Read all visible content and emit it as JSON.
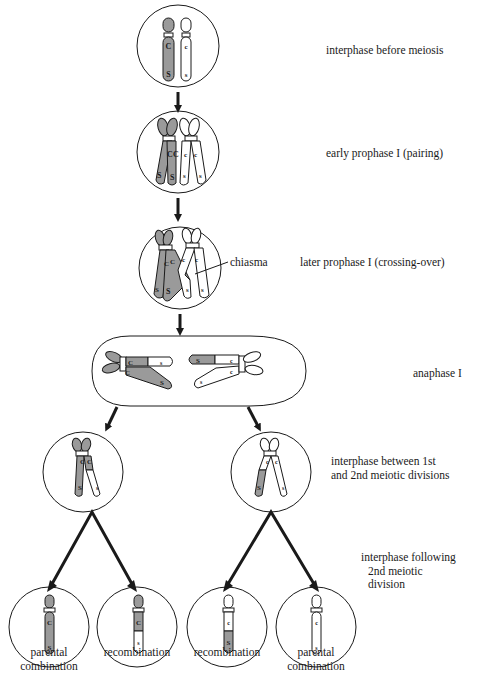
{
  "diagram": {
    "colors": {
      "background": "#ffffff",
      "shaded_chromatid": "#9a9a9a",
      "unshaded_chromatid": "#ffffff",
      "outline": "#1a1a1a"
    },
    "stages": [
      {
        "id": "stage1",
        "label": "interphase before meiosis"
      },
      {
        "id": "stage2",
        "label": "early prophase I (pairing)"
      },
      {
        "id": "stage3",
        "label": "later prophase I (crossing-over)",
        "annotation": "chiasma"
      },
      {
        "id": "stage4",
        "label": "anaphase I"
      },
      {
        "id": "stage5",
        "label_line1": "interphase between 1st",
        "label_line2": "and 2nd meiotic divisions"
      },
      {
        "id": "stage6",
        "label_line1": "interphase following",
        "label_line2": "2nd meiotic",
        "label_line3": "division"
      }
    ],
    "alleles": {
      "dominant_c": "C",
      "recessive_c": "c",
      "dominant_s": "S",
      "recessive_s": "s"
    },
    "products": [
      {
        "label_line1": "parental",
        "label_line2": "combination",
        "genotype": "C S"
      },
      {
        "label_line1": "recombination",
        "label_line2": "",
        "genotype": "C s"
      },
      {
        "label_line1": "recombination",
        "label_line2": "",
        "genotype": "c S"
      },
      {
        "label_line1": "parental",
        "label_line2": "combination",
        "genotype": "c s"
      }
    ]
  }
}
